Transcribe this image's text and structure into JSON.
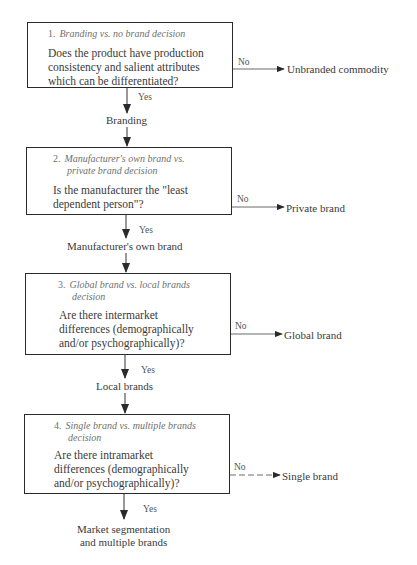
{
  "diagram": {
    "type": "decision-flowchart",
    "steps": [
      {
        "number": "1.",
        "title": "Branding vs. no brand decision",
        "question": [
          "Does the product have production",
          "consistency and salient attributes",
          "which can be differentiated?"
        ],
        "no_label": "No",
        "no_outcome": "Unbranded commodity",
        "yes_label": "Yes",
        "yes_outcome": "Branding"
      },
      {
        "number": "2.",
        "title": [
          "Manufacturer's own brand vs.",
          "private brand decision"
        ],
        "question": [
          "Is the manufacturer the \"least",
          "dependent person\"?"
        ],
        "no_label": "No",
        "no_outcome": "Private brand",
        "yes_label": "Yes",
        "yes_outcome": "Manufacturer's own brand"
      },
      {
        "number": "3.",
        "title": [
          "Global brand vs. local brands",
          "decision"
        ],
        "question": [
          "Are there intermarket",
          "differences (demographically",
          "and/or psychographically)?"
        ],
        "no_label": "No",
        "no_outcome": "Global brand",
        "yes_label": "Yes",
        "yes_outcome": "Local brands"
      },
      {
        "number": "4.",
        "title": [
          "Single brand vs. multiple brands",
          "decision"
        ],
        "question": [
          "Are there intramarket",
          "differences (demographically",
          "and/or psychographically)?"
        ],
        "no_label": "No",
        "no_outcome": "Single brand",
        "yes_label": "Yes",
        "yes_outcome": [
          "Market segmentation",
          "and multiple brands"
        ]
      }
    ]
  }
}
